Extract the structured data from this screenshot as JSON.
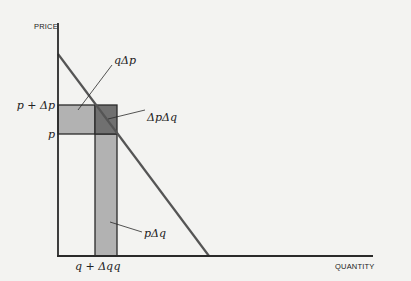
{
  "diagram": {
    "type": "economics-demand-revenue-decomposition",
    "axes": {
      "y_label": "PRICE",
      "x_label": "QUANTITY"
    },
    "tick_labels": {
      "price_high": "p + Δp",
      "price_low": "p",
      "quantity_low": "q + Δq",
      "quantity_high": "q"
    },
    "region_labels": {
      "top_rect": "qΔp",
      "corner_square": "ΔpΔq",
      "vertical_strip": "pΔq"
    },
    "colors": {
      "background": "#f3f3f1",
      "axis": "#2a2a2a",
      "demand_line": "#555555",
      "light_fill": "#b2b2b2",
      "dark_fill": "#707070",
      "outline": "#2a2a2a"
    },
    "geometry": {
      "origin": [
        58,
        256
      ],
      "y_axis_top": 23,
      "x_axis_right": 373,
      "demand_start": [
        58,
        54
      ],
      "demand_end": [
        209,
        256
      ],
      "p_plus_dp_y": 105,
      "p_y": 134,
      "q_plus_dq_x": 95,
      "q_x": 117
    }
  }
}
